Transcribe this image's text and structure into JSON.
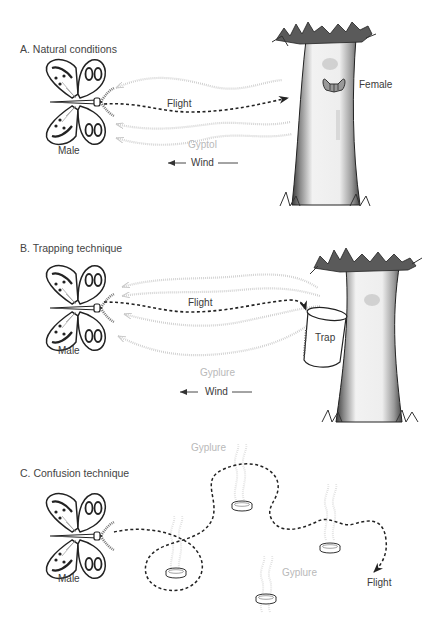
{
  "panels": [
    {
      "id": "A",
      "title": "A. Natural conditions",
      "labels": {
        "male": "Male",
        "flight": "Flight",
        "pheromone": "Gyptol",
        "wind": "Wind",
        "female": "Female"
      },
      "icons": [
        "butterfly-male-icon",
        "tree-icon",
        "female-moth-icon",
        "dotted-flight-arrow",
        "pheromone-plume-arrows",
        "wind-arrow"
      ]
    },
    {
      "id": "B",
      "title": "B. Trapping technique",
      "labels": {
        "male": "Male",
        "flight": "Flight",
        "pheromone": "Gyplure",
        "wind": "Wind",
        "trap": "Trap"
      },
      "icons": [
        "butterfly-male-icon",
        "tree-icon",
        "trap-bucket-icon",
        "dotted-flight-arrow",
        "pheromone-plume-arrows",
        "wind-arrow"
      ]
    },
    {
      "id": "C",
      "title": "C. Confusion technique",
      "labels": {
        "male": "Male",
        "flight": "Flight",
        "pheromone_1": "Gyplure",
        "pheromone_2": "Gyplure"
      },
      "icons": [
        "butterfly-male-icon",
        "dispenser-dish-icon",
        "meandering-flight-path"
      ]
    }
  ],
  "colors": {
    "text": "#3a3a3a",
    "pheromone": "#c4c4c4",
    "flight": "#222222",
    "tree_shade": "#555555"
  }
}
